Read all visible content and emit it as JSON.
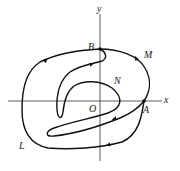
{
  "figure": {
    "type": "phase-plane curve diagram",
    "axes": {
      "x_label": "x",
      "y_label": "y",
      "origin_label": "O"
    },
    "points": {
      "A": "A",
      "B": "B"
    },
    "curve_labels": {
      "M": "M",
      "N": "N",
      "L": "L"
    },
    "colors": {
      "stroke": "#111111",
      "axis": "#333333",
      "background": "#ffffff"
    }
  }
}
